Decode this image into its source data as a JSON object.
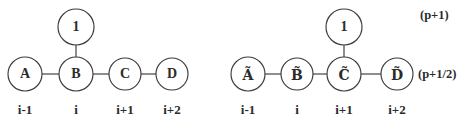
{
  "figure": {
    "background_color": "#ffffff",
    "stroke_color": "#3a3a3a",
    "text_color": "#2b2b2b",
    "diagrams": [
      {
        "id": "left-stencil",
        "top_node": {
          "label": "1",
          "cx": 76,
          "cy": 27,
          "r": 18
        },
        "nodes": [
          {
            "label": "A",
            "index_label": "i-1",
            "cx": 25,
            "cy": 74,
            "r": 17
          },
          {
            "label": "B",
            "index_label": "i",
            "cx": 76,
            "cy": 74,
            "r": 17
          },
          {
            "label": "C",
            "index_label": "i+1",
            "cx": 125,
            "cy": 74,
            "r": 16
          },
          {
            "label": "D",
            "index_label": "i+2",
            "cx": 172,
            "cy": 74,
            "r": 16
          }
        ]
      },
      {
        "id": "right-stencil",
        "top_node": {
          "label": "1",
          "cx": 344,
          "cy": 27,
          "r": 18
        },
        "nodes": [
          {
            "label": "Ã",
            "index_label": "i-1",
            "cx": 248,
            "cy": 74,
            "r": 17
          },
          {
            "label": "B̃",
            "index_label": "i",
            "cx": 297,
            "cy": 74,
            "r": 16
          },
          {
            "label": "C̃",
            "index_label": "i+1",
            "cx": 344,
            "cy": 74,
            "r": 17
          },
          {
            "label": "D̃",
            "index_label": "i+2",
            "cx": 397,
            "cy": 74,
            "r": 16
          }
        ]
      }
    ],
    "row_labels": [
      {
        "text": "(p+1)",
        "x": 420,
        "y": 16
      },
      {
        "text": "(p+1/2)",
        "x": 418,
        "y": 75
      }
    ]
  }
}
